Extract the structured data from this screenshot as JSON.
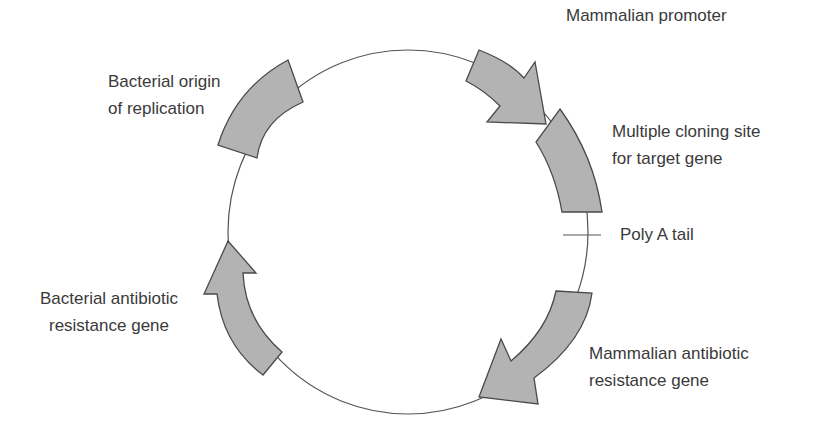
{
  "diagram": {
    "type": "plasmid-map",
    "colors": {
      "background": "#ffffff",
      "backbone": "#555555",
      "feature_fill": "#b3b3b3",
      "feature_stroke": "#4a4a4a",
      "text": "#3a3a3a"
    },
    "features": [
      {
        "id": "mammalian-promoter",
        "shape": "arrow",
        "direction": "clockwise",
        "lines": [
          "Mammalian promoter"
        ]
      },
      {
        "id": "multiple-cloning-site",
        "shape": "block",
        "lines": [
          "Multiple cloning site",
          "for target gene"
        ]
      },
      {
        "id": "poly-a-tail",
        "shape": "tick",
        "lines": [
          "Poly A tail"
        ]
      },
      {
        "id": "mammalian-antibiotic-resistance",
        "shape": "arrow",
        "direction": "clockwise",
        "lines": [
          "Mammalian antibiotic",
          "resistance gene"
        ]
      },
      {
        "id": "bacterial-antibiotic-resistance",
        "shape": "arrow",
        "direction": "clockwise",
        "lines": [
          "Bacterial antibiotic",
          "resistance gene"
        ]
      },
      {
        "id": "bacterial-origin",
        "shape": "block",
        "lines": [
          "Bacterial origin",
          "of replication"
        ]
      }
    ]
  }
}
